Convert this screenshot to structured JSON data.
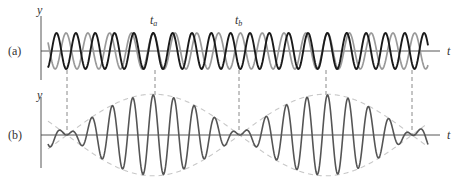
{
  "figure": {
    "panel_a": {
      "label": "(a)",
      "y_axis_label": "y",
      "x_axis_label": "t",
      "marker_a": {
        "base": "t",
        "sub": "a"
      },
      "marker_b": {
        "base": "t",
        "sub": "b"
      }
    },
    "panel_b": {
      "label": "(b)",
      "y_axis_label": "y",
      "x_axis_label": "t"
    },
    "colors": {
      "wave1": "#1a1a1a",
      "wave2": "#9a9a9a",
      "sum": "#555555",
      "envelope": "#c8c8c8",
      "axis": "#444444",
      "guide": "#8a8a8a"
    }
  },
  "chart_data": {
    "type": "line",
    "panels": [
      {
        "id": "a",
        "description": "Two individual sinusoidal waves y1 and y2 with slightly different frequencies",
        "xlabel": "t",
        "ylabel": "y",
        "series": [
          {
            "name": "y1 (black)",
            "amplitude": 1,
            "carrier_period_px": 20.5,
            "beat_period_px": 172.5
          },
          {
            "name": "y2 (gray)",
            "amplitude": 1,
            "carrier_period_px": 20.5,
            "beat_period_px": 172.5
          }
        ],
        "markers": [
          {
            "name": "t_a",
            "x_px": 155,
            "note": "waves in phase"
          },
          {
            "name": "t_b",
            "x_px": 239,
            "note": "waves out of phase"
          }
        ]
      },
      {
        "id": "b",
        "description": "Resultant y = y1 + y2 showing amplitude-modulated beats with dashed envelope",
        "xlabel": "t",
        "ylabel": "y",
        "series": [
          {
            "name": "y1 + y2",
            "max_amplitude": 2
          }
        ],
        "envelope_nodes_px": [
          67,
          239,
          412
        ],
        "envelope_maxima_px": [
          155,
          326
        ]
      }
    ],
    "guide_lines_x_px": [
      67,
      155,
      239,
      326,
      412
    ]
  }
}
